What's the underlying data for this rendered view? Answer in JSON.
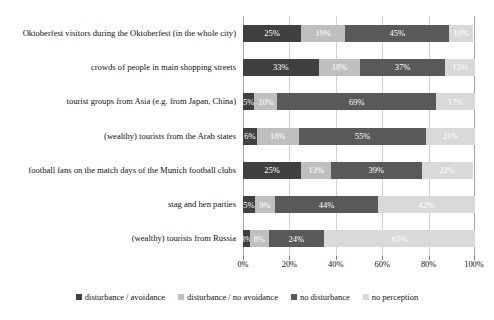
{
  "chart_data": {
    "type": "bar",
    "orientation": "horizontal",
    "stacked": true,
    "normalized": "100%",
    "title": "",
    "xlabel": "",
    "ylabel": "",
    "xlim": [
      0,
      100
    ],
    "grid": true,
    "legend_position": "bottom",
    "xticks": [
      "0%",
      "20%",
      "40%",
      "60%",
      "80%",
      "100%"
    ],
    "xtick_values": [
      0,
      20,
      40,
      60,
      80,
      100
    ],
    "categories": [
      "Oktoberfest visitors during the Oktoberfest (in the whole city)",
      "crowds of people in main shopping streets",
      "tourist groups from Asia (e.g. from Japan, China)",
      "(wealthy) tourists from the Arab states",
      "football fans on the match days of the Munich football clubs",
      "stag and hen parties",
      "(wealthy) tourists from Russia"
    ],
    "series": [
      {
        "name": "disturbance / avoidance",
        "color": "#404040",
        "values": [
          25,
          33,
          5,
          6,
          25,
          5,
          3
        ]
      },
      {
        "name": "disturbance / no avoidance",
        "color": "#bfbfbf",
        "values": [
          19,
          18,
          10,
          18,
          13,
          9,
          8
        ]
      },
      {
        "name": "no disturbance",
        "color": "#595959",
        "values": [
          45,
          37,
          69,
          55,
          39,
          44,
          24
        ]
      },
      {
        "name": "no perception",
        "color": "#d9d9d9",
        "values": [
          10,
          13,
          17,
          21,
          22,
          42,
          65
        ]
      }
    ],
    "data_labels": [
      [
        "25%",
        "19%",
        "45%",
        "10%"
      ],
      [
        "33%",
        "18%",
        "37%",
        "13%"
      ],
      [
        "5%",
        "10%",
        "69%",
        "17%"
      ],
      [
        "6%",
        "18%",
        "55%",
        "21%"
      ],
      [
        "25%",
        "13%",
        "39%",
        "22%"
      ],
      [
        "5%",
        "9%",
        "44%",
        "42%"
      ],
      [
        "3%",
        "8%",
        "24%",
        "65%"
      ]
    ]
  }
}
